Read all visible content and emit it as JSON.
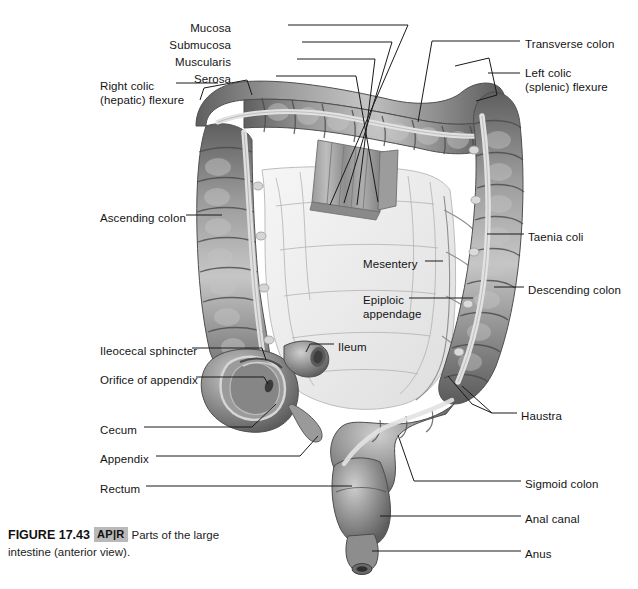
{
  "figure": {
    "number": "FIGURE 17.43",
    "badge": {
      "left": "AP",
      "divider": "|",
      "right": "R"
    },
    "caption_part1": "Parts of the large",
    "caption_part2": "intestine (anterior view).",
    "full_caption": "Parts of the large intestine (anterior view)."
  },
  "palette": {
    "background": "#ffffff",
    "leader_line": "#1a1a1a",
    "label_text": "#141414",
    "tissue_dark": "#6f6f6f",
    "tissue_mid": "#8d8d8d",
    "tissue_light": "#b4b4b4",
    "tissue_highlight": "#d8d8d8",
    "taenia_band": "#e2e2e2",
    "mesentery": "#efefef",
    "mesentery_line": "#9a9a9a",
    "badge_bg": "#b9b9b9"
  },
  "labels": [
    {
      "id": "mucosa",
      "text": "Mucosa",
      "x": 231,
      "y": 28,
      "align": "right"
    },
    {
      "id": "submucosa",
      "text": "Submucosa",
      "x": 231,
      "y": 45,
      "align": "right"
    },
    {
      "id": "muscularis",
      "text": "Muscularis",
      "x": 231,
      "y": 62,
      "align": "right"
    },
    {
      "id": "serosa",
      "text": "Serosa",
      "x": 231,
      "y": 79,
      "align": "right"
    },
    {
      "id": "transverse-colon",
      "text": "Transverse colon",
      "x": 525,
      "y": 44,
      "align": "left"
    },
    {
      "id": "left-colic-flexure",
      "text": "Left colic",
      "x": 525,
      "y": 73,
      "align": "left"
    },
    {
      "id": "left-colic-flexure-2",
      "text": "(splenic) flexure",
      "x": 525,
      "y": 87,
      "align": "left"
    },
    {
      "id": "right-colic-flexure",
      "text": "Right colic",
      "x": 100,
      "y": 86,
      "align": "left"
    },
    {
      "id": "right-colic-flexure-2",
      "text": "(hepatic) flexure",
      "x": 100,
      "y": 100,
      "align": "left"
    },
    {
      "id": "ascending-colon",
      "text": "Ascending colon",
      "x": 100,
      "y": 218,
      "align": "left"
    },
    {
      "id": "taenia-coli",
      "text": "Taenia coli",
      "x": 528,
      "y": 237,
      "align": "left"
    },
    {
      "id": "mesentery",
      "text": "Mesentery",
      "x": 363,
      "y": 264,
      "align": "left"
    },
    {
      "id": "descending-colon",
      "text": "Descending colon",
      "x": 528,
      "y": 290,
      "align": "left"
    },
    {
      "id": "epiploic-appendage",
      "text": "Epiploic",
      "x": 363,
      "y": 300,
      "align": "left"
    },
    {
      "id": "epiploic-appendage-2",
      "text": "appendage",
      "x": 363,
      "y": 314,
      "align": "left"
    },
    {
      "id": "ileocecal-sphincter",
      "text": "Ileocecal sphincter",
      "x": 100,
      "y": 351,
      "align": "left"
    },
    {
      "id": "ileum",
      "text": "Ileum",
      "x": 338,
      "y": 347,
      "align": "left"
    },
    {
      "id": "orifice-of-appendix",
      "text": "Orifice of appendix",
      "x": 100,
      "y": 380,
      "align": "left"
    },
    {
      "id": "cecum",
      "text": "Cecum",
      "x": 100,
      "y": 430,
      "align": "left"
    },
    {
      "id": "haustra",
      "text": "Haustra",
      "x": 521,
      "y": 416,
      "align": "left"
    },
    {
      "id": "appendix",
      "text": "Appendix",
      "x": 100,
      "y": 459,
      "align": "left"
    },
    {
      "id": "rectum",
      "text": "Rectum",
      "x": 100,
      "y": 489,
      "align": "left"
    },
    {
      "id": "sigmoid-colon",
      "text": "Sigmoid colon",
      "x": 525,
      "y": 484,
      "align": "left"
    },
    {
      "id": "anal-canal",
      "text": "Anal canal",
      "x": 525,
      "y": 519,
      "align": "left"
    },
    {
      "id": "anus",
      "text": "Anus",
      "x": 525,
      "y": 554,
      "align": "left"
    }
  ],
  "structures": [
    "ascending colon",
    "transverse colon",
    "descending colon",
    "sigmoid colon",
    "cecum",
    "appendix",
    "rectum",
    "anal canal",
    "anus",
    "ileum",
    "right colic (hepatic) flexure",
    "left colic (splenic) flexure",
    "taenia coli",
    "haustra",
    "epiploic appendage",
    "mesentery",
    "ileocecal sphincter",
    "orifice of appendix",
    "mucosa",
    "submucosa",
    "muscularis",
    "serosa"
  ]
}
